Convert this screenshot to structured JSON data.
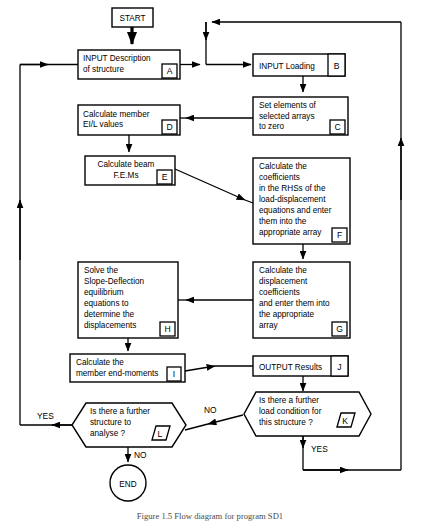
{
  "figure": {
    "title": "Flow diagram for program SD1",
    "caption": "Figure 1.5  Flow diagram for program SD1",
    "type": "flowchart",
    "colors": {
      "stroke": "#000000",
      "fill": "#ffffff",
      "caption": "#4a4a4a"
    }
  },
  "nodes": {
    "start": {
      "label": "START",
      "shape": "terminator"
    },
    "a": {
      "tag": "A",
      "shape": "process",
      "lines": [
        "INPUT Description",
        "of structure"
      ]
    },
    "b": {
      "tag": "B",
      "shape": "process",
      "lines": [
        "INPUT Loading"
      ]
    },
    "c": {
      "tag": "C",
      "shape": "process",
      "lines": [
        "Set elements of",
        "selected arrays",
        "to zero"
      ]
    },
    "d": {
      "tag": "D",
      "shape": "process",
      "lines": [
        "Calculate member",
        "EI/L values"
      ]
    },
    "e": {
      "tag": "E",
      "shape": "process",
      "lines": [
        "Calculate beam",
        "F.E.Ms"
      ]
    },
    "f": {
      "tag": "F",
      "shape": "process",
      "lines": [
        "Calculate the",
        "coefficients",
        "in the RHSs of the",
        "load-displacement",
        "equations and enter",
        "them into the",
        "appropriate array"
      ]
    },
    "g": {
      "tag": "G",
      "shape": "process",
      "lines": [
        "Calculate the",
        "displacement",
        "coefficients",
        "and enter them into",
        "the appropriate",
        "array"
      ]
    },
    "h": {
      "tag": "H",
      "shape": "process",
      "lines": [
        "Solve the",
        "Slope-Deflection",
        "equilibrium",
        "equations to",
        "determine the",
        "displacements"
      ]
    },
    "i": {
      "tag": "I",
      "shape": "process",
      "lines": [
        "Calculate the",
        "member end-moments"
      ]
    },
    "j": {
      "tag": "J",
      "shape": "process",
      "lines": [
        "OUTPUT Results"
      ]
    },
    "k": {
      "tag": "K",
      "shape": "decision",
      "lines": [
        "Is there a further",
        "load condition for",
        "this structure ?"
      ]
    },
    "l": {
      "tag": "L",
      "shape": "decision",
      "lines": [
        "Is there a further",
        "structure to",
        "analyse ?"
      ]
    },
    "end": {
      "label": "END",
      "shape": "terminator"
    }
  },
  "edge_labels": {
    "k_no": "NO",
    "k_yes": "YES",
    "l_yes": "YES",
    "l_no": "NO"
  }
}
